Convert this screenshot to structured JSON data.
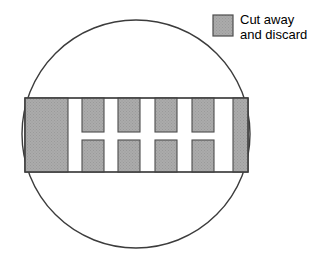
{
  "figure": {
    "canvas": {
      "width": 327,
      "height": 265,
      "background": "#ffffff"
    },
    "colors": {
      "cut_fill": "#a8a8a8",
      "cut_stroke": "#4d4d4d",
      "outline": "#3c3c3c",
      "band_fill": "#ffffff",
      "text": "#000000"
    },
    "circle": {
      "name": "wafer-outline",
      "cx": 136,
      "cy": 134,
      "r": 114,
      "stroke_width": 1.4,
      "fill": "none"
    },
    "band": {
      "name": "horizontal-band",
      "x": 25,
      "y": 98,
      "width": 223,
      "height": 74,
      "stroke_width": 1.2
    },
    "solid_blocks": [
      {
        "name": "left-solid-block",
        "x": 25,
        "y": 98,
        "width": 43,
        "height": 74
      },
      {
        "name": "right-solid-block",
        "x": 233,
        "y": 98,
        "width": 15,
        "height": 74
      }
    ],
    "top_tabs": {
      "name": "top-tab-row",
      "y": 98,
      "height": 34,
      "width": 22,
      "xs": [
        82,
        118,
        155,
        192
      ]
    },
    "bottom_tabs": {
      "name": "bottom-tab-row",
      "y": 140,
      "height": 32,
      "width": 22,
      "xs": [
        82,
        118,
        155,
        192
      ]
    },
    "legend": {
      "name": "legend",
      "swatch": {
        "x": 213,
        "y": 15,
        "width": 20,
        "height": 21
      },
      "line1": "Cut away",
      "line2": "and discard",
      "text_x": 240,
      "line1_y": 24,
      "line2_y": 39
    }
  }
}
